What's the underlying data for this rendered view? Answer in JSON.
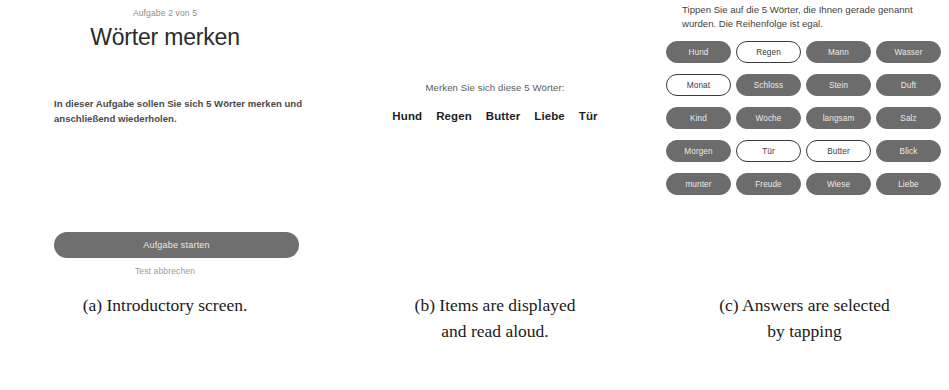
{
  "panel_a": {
    "step_label": "Aufgabe 2 von 5",
    "title": "Wörter merken",
    "body": "In dieser Aufgabe sollen Sie sich 5 Wörter merken und anschließend wiederholen.",
    "primary_button": "Aufgabe starten",
    "secondary_link": "Test abbrechen",
    "button_color": "#6f6f6f"
  },
  "panel_b": {
    "prompt": "Merken Sie sich diese 5 Wörter:",
    "words": [
      "Hund",
      "Regen",
      "Butter",
      "Liebe",
      "Tür"
    ]
  },
  "panel_c": {
    "prompt": "Tippen Sie auf die 5 Wörter, die Ihnen gerade genannt wurden. Die Reihenfolge ist egal.",
    "pill_filled_color": "#6c6c6c",
    "pill_outline_color": "#3a3a3a",
    "options": [
      {
        "label": "Hund",
        "state": "filled"
      },
      {
        "label": "Regen",
        "state": "outlined"
      },
      {
        "label": "Mann",
        "state": "filled"
      },
      {
        "label": "Wasser",
        "state": "filled"
      },
      {
        "label": "Monat",
        "state": "outlined"
      },
      {
        "label": "Schloss",
        "state": "filled"
      },
      {
        "label": "Stein",
        "state": "filled"
      },
      {
        "label": "Duft",
        "state": "filled"
      },
      {
        "label": "Kind",
        "state": "filled"
      },
      {
        "label": "Woche",
        "state": "filled"
      },
      {
        "label": "langsam",
        "state": "filled"
      },
      {
        "label": "Salz",
        "state": "filled"
      },
      {
        "label": "Morgen",
        "state": "filled"
      },
      {
        "label": "Tür",
        "state": "outlined"
      },
      {
        "label": "Butter",
        "state": "outlined"
      },
      {
        "label": "Blick",
        "state": "filled"
      },
      {
        "label": "munter",
        "state": "filled"
      },
      {
        "label": "Freude",
        "state": "filled"
      },
      {
        "label": "Wiese",
        "state": "filled"
      },
      {
        "label": "Liebe",
        "state": "filled"
      }
    ]
  },
  "captions": {
    "a": [
      "(a) Introductory screen."
    ],
    "b": [
      "(b) Items are displayed",
      "and read aloud."
    ],
    "c": [
      "(c) Answers are selected",
      "by tapping"
    ]
  }
}
